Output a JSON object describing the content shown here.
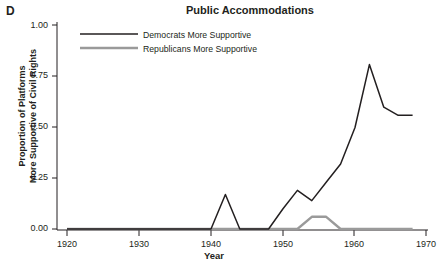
{
  "panel": {
    "label": "D"
  },
  "chart_data": {
    "type": "line",
    "title": "Public Accommodations",
    "xlabel": "Year",
    "ylabel_line1": "Proportion of Platforms",
    "ylabel_line2": "More Supportive of Civil Rights",
    "xlim": [
      1918,
      1968
    ],
    "ylim": [
      0.0,
      1.0
    ],
    "xticks": [
      1920,
      1930,
      1940,
      1950,
      1960,
      1970
    ],
    "xtick_labels": [
      "1920",
      "1930",
      "1940",
      "1950",
      "1960",
      "1970"
    ],
    "yticks": [
      0.0,
      0.25,
      0.5,
      0.75,
      1.0
    ],
    "ytick_labels": [
      "0.00",
      "0.25",
      "0.50",
      "0.75",
      "1.00"
    ],
    "grid": false,
    "legend_position": "top-left",
    "series": [
      {
        "name": "Democrats More Supportive",
        "color": "#231f20",
        "x": [
          1920,
          1924,
          1928,
          1932,
          1936,
          1940,
          1942,
          1944,
          1946,
          1948,
          1950,
          1952,
          1954,
          1956,
          1958,
          1960,
          1962,
          1964,
          1966,
          1968
        ],
        "values": [
          0.0,
          0.0,
          0.0,
          0.0,
          0.0,
          0.0,
          0.17,
          0.0,
          0.0,
          0.0,
          0.1,
          0.19,
          0.14,
          0.23,
          0.32,
          0.5,
          0.81,
          0.6,
          0.56,
          0.56
        ]
      },
      {
        "name": "Republicans More Supportive",
        "color": "#9a9a9a",
        "x": [
          1920,
          1930,
          1940,
          1950,
          1952,
          1954,
          1956,
          1958,
          1960,
          1968
        ],
        "values": [
          0.0,
          0.0,
          0.0,
          0.0,
          0.0,
          0.06,
          0.06,
          0.0,
          0.0,
          0.0
        ]
      }
    ]
  },
  "legend": {
    "items": [
      {
        "label": "Democrats More Supportive",
        "color": "#231f20"
      },
      {
        "label": "Republicans More Supportive",
        "color": "#9a9a9a"
      }
    ]
  }
}
